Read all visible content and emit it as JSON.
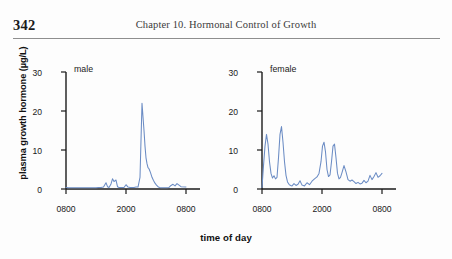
{
  "page": {
    "folio": "342",
    "running_head": "Chapter 10.  Hormonal Control of Growth"
  },
  "figure": {
    "y_axis_title": "plasma growth hormone (µg/L)",
    "x_axis_title": "time of day",
    "line_color": "#6b8cc4",
    "axis_color": "#1a1a1a",
    "panels": [
      {
        "label": "male",
        "x_tick_labels": [
          "0800",
          "2000",
          "0800"
        ]
      },
      {
        "label": "female",
        "x_tick_labels": [
          "0800",
          "2000",
          "0800"
        ]
      }
    ],
    "y_tick_labels": [
      "0",
      "10",
      "20",
      "30"
    ]
  },
  "chart_data": {
    "type": "line",
    "title": "",
    "xlabel": "time of day",
    "ylabel": "plasma growth hormone (µg/L)",
    "ylim": [
      0,
      30
    ],
    "xlim": [
      800,
      3200
    ],
    "y_ticks": [
      0,
      10,
      20,
      30
    ],
    "x_ticks": [
      800,
      2000,
      3200
    ],
    "x_tick_labels": [
      "0800",
      "2000",
      "0800"
    ],
    "grid": false,
    "legend": "none",
    "panels": [
      {
        "name": "male",
        "x_hours_from_0800": [
          0,
          0.5,
          1,
          1.5,
          2,
          2.5,
          3,
          3.5,
          4,
          4.5,
          5,
          5.5,
          6,
          6.5,
          7,
          7.5,
          8,
          8.3,
          8.6,
          9,
          9.3,
          9.6,
          10,
          10.3,
          10.6,
          11,
          11.3,
          11.6,
          12,
          12.4,
          12.8,
          13.2,
          13.6,
          14,
          14.4,
          14.8,
          15.2,
          15.6,
          15.8,
          16,
          16.2,
          16.4,
          16.6,
          16.9,
          17.2,
          17.5,
          17.8,
          18.1,
          18.4,
          18.7,
          19,
          19.4,
          19.8,
          20.2,
          20.6,
          21,
          21.4,
          21.8,
          22.2,
          22.6,
          23,
          24
        ],
        "values": [
          0.4,
          0.3,
          0.3,
          0.3,
          0.3,
          0.3,
          0.3,
          0.3,
          0.3,
          0.3,
          0.3,
          0.3,
          0.3,
          0.4,
          0.4,
          0.5,
          1.6,
          0.6,
          0.4,
          1.3,
          2.6,
          1.9,
          2.3,
          0.6,
          0.4,
          0.4,
          0.4,
          0.4,
          1.1,
          0.5,
          0.4,
          0.4,
          0.4,
          0.5,
          0.5,
          3.0,
          22.0,
          15.0,
          11.0,
          8.0,
          6.5,
          5.5,
          5.2,
          4.2,
          3.0,
          2.2,
          1.5,
          1.0,
          0.6,
          0.4,
          0.3,
          0.3,
          0.3,
          0.3,
          0.4,
          0.9,
          1.2,
          0.8,
          1.4,
          1.0,
          0.6,
          0.5
        ]
      },
      {
        "name": "female",
        "x_hours_from_0800": [
          0,
          0.3,
          0.6,
          0.9,
          1.2,
          1.5,
          1.8,
          2.1,
          2.4,
          2.7,
          3.0,
          3.3,
          3.6,
          3.9,
          4.2,
          4.5,
          4.8,
          5.1,
          5.4,
          5.7,
          6.0,
          6.4,
          6.8,
          7.2,
          7.6,
          8.0,
          8.5,
          9.0,
          9.5,
          10.0,
          10.5,
          11.0,
          11.4,
          11.8,
          12.1,
          12.4,
          12.7,
          13.0,
          13.3,
          13.6,
          13.9,
          14.2,
          14.5,
          14.8,
          15.1,
          15.4,
          15.7,
          16.0,
          16.4,
          16.8,
          17.2,
          17.6,
          18.0,
          18.4,
          18.8,
          19.2,
          19.6,
          20.0,
          20.4,
          20.8,
          21.2,
          21.6,
          22.0,
          22.4,
          22.8,
          23.2,
          23.6,
          24.0
        ],
        "values": [
          0.4,
          6.0,
          11.0,
          14.0,
          11.5,
          7.0,
          4.0,
          2.8,
          3.4,
          2.6,
          3.0,
          8.0,
          14.0,
          16.0,
          12.0,
          7.0,
          3.5,
          1.8,
          1.2,
          0.9,
          0.8,
          1.4,
          0.9,
          1.2,
          2.1,
          1.0,
          0.8,
          1.6,
          1.1,
          2.0,
          2.6,
          3.1,
          4.0,
          7.0,
          11.0,
          12.0,
          9.5,
          5.0,
          3.2,
          3.6,
          7.0,
          11.0,
          11.5,
          8.0,
          4.0,
          2.6,
          3.0,
          4.2,
          6.0,
          4.4,
          2.4,
          2.0,
          2.3,
          1.9,
          1.4,
          1.7,
          1.3,
          1.5,
          2.2,
          1.6,
          2.0,
          3.5,
          2.4,
          3.2,
          4.2,
          3.0,
          3.4,
          4.0
        ]
      }
    ]
  }
}
